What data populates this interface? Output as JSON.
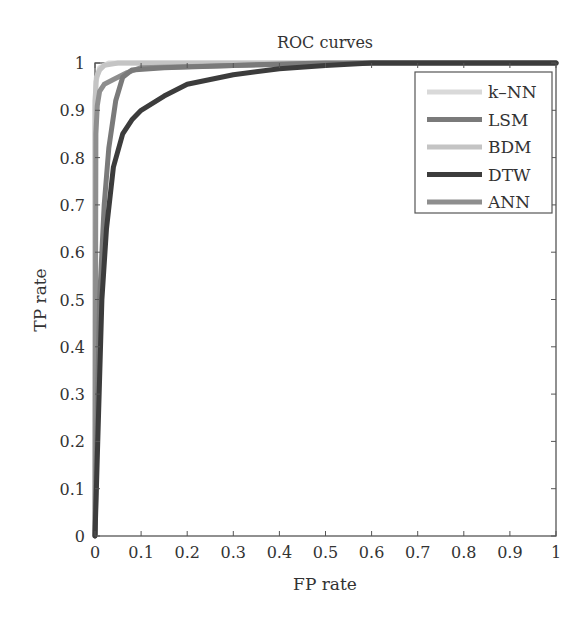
{
  "chart_data": {
    "type": "line",
    "title": "ROC curves",
    "xlabel": "FP rate",
    "ylabel": "TP rate",
    "xlim": [
      0,
      1
    ],
    "ylim": [
      0,
      1
    ],
    "xticks": [
      "0",
      "0.1",
      "0.2",
      "0.3",
      "0.4",
      "0.5",
      "0.6",
      "0.7",
      "0.8",
      "0.9",
      "1"
    ],
    "yticks": [
      "0",
      "0.1",
      "0.2",
      "0.3",
      "0.4",
      "0.5",
      "0.6",
      "0.7",
      "0.8",
      "0.9",
      "1"
    ],
    "grid": false,
    "legend_position": "upper right",
    "series": [
      {
        "name": "k–NN",
        "color": "#d9d9d9",
        "x": [
          0,
          0.0,
          0.002,
          0.01,
          0.03,
          0.1,
          1.0
        ],
        "y": [
          0,
          0.9,
          0.96,
          0.99,
          1.0,
          1.0,
          1.0
        ]
      },
      {
        "name": "LSM",
        "color": "#7a7a7a",
        "x": [
          0,
          0.01,
          0.02,
          0.03,
          0.045,
          0.06,
          0.08,
          0.15,
          0.3,
          0.5,
          1.0
        ],
        "y": [
          0,
          0.5,
          0.7,
          0.82,
          0.92,
          0.97,
          0.985,
          0.99,
          0.995,
          1.0,
          1.0
        ]
      },
      {
        "name": "BDM",
        "color": "#c4c4c4",
        "x": [
          0,
          0.0,
          0.003,
          0.01,
          0.02,
          0.05,
          0.2,
          1.0
        ],
        "y": [
          0,
          0.92,
          0.97,
          0.985,
          0.995,
          1.0,
          1.0,
          1.0
        ]
      },
      {
        "name": "DTW",
        "color": "#3c3c3c",
        "x": [
          0,
          0.015,
          0.025,
          0.04,
          0.06,
          0.08,
          0.1,
          0.15,
          0.2,
          0.3,
          0.4,
          0.5,
          0.6,
          1.0
        ],
        "y": [
          0,
          0.5,
          0.65,
          0.78,
          0.85,
          0.88,
          0.9,
          0.93,
          0.955,
          0.975,
          0.988,
          0.995,
          1.0,
          1.0
        ]
      },
      {
        "name": "ANN",
        "color": "#8e8e8e",
        "x": [
          0,
          0.002,
          0.005,
          0.01,
          0.02,
          0.04,
          0.07,
          0.1,
          0.3,
          0.6,
          1.0
        ],
        "y": [
          0,
          0.85,
          0.91,
          0.94,
          0.955,
          0.965,
          0.98,
          0.99,
          0.995,
          1.0,
          1.0
        ]
      }
    ]
  }
}
